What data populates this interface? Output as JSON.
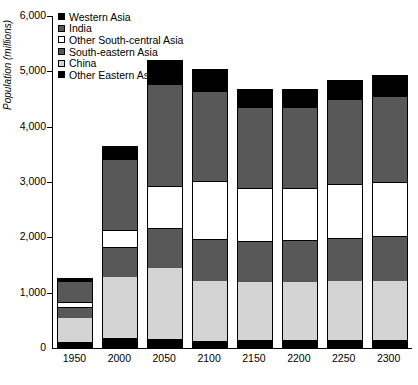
{
  "chart_data": {
    "type": "bar",
    "subtype": "stacked-column",
    "title": "",
    "xlabel": "",
    "ylabel": "Population (millions)",
    "ylim": [
      0,
      6000
    ],
    "ytick_labels": [
      "6,000",
      "5,000",
      "4,000",
      "3,000",
      "2,000",
      "1,000",
      "0"
    ],
    "ytick_values": [
      6000,
      5000,
      4000,
      3000,
      2000,
      1000,
      0
    ],
    "grid": false,
    "legend_position": "top-left-inside",
    "categories": [
      "1950",
      "2000",
      "2050",
      "2100",
      "2150",
      "2200",
      "2250",
      "2300"
    ],
    "series": [
      {
        "name": "Other Eastern Asia",
        "swatch": "#000000",
        "values": [
          100,
          180,
          170,
          130,
          140,
          140,
          140,
          140
        ]
      },
      {
        "name": "China",
        "swatch": "#d4d4d4",
        "values": [
          450,
          1100,
          1280,
          1090,
          1050,
          1050,
          1070,
          1070
        ]
      },
      {
        "name": "South-eastern Asia",
        "swatch": "#585858",
        "values": [
          180,
          530,
          700,
          740,
          720,
          740,
          760,
          790
        ]
      },
      {
        "name": "Other South-central Asia",
        "swatch": "#ffffff",
        "values": [
          100,
          330,
          780,
          1050,
          990,
          960,
          990,
          1000
        ]
      },
      {
        "name": "India",
        "swatch": "#585858",
        "values": [
          370,
          1260,
          1830,
          1620,
          1440,
          1450,
          1520,
          1540
        ]
      },
      {
        "name": "Western Asia",
        "swatch": "#000000",
        "values": [
          60,
          250,
          450,
          410,
          340,
          340,
          370,
          390
        ]
      }
    ],
    "totals": [
      1260,
      3650,
      5210,
      5040,
      4680,
      4680,
      4850,
      4930
    ]
  },
  "legend": {
    "items": [
      {
        "label": "Western Asia"
      },
      {
        "label": "India"
      },
      {
        "label": "Other South-central Asia"
      },
      {
        "label": "South-eastern Asia"
      },
      {
        "label": "China"
      },
      {
        "label": "Other Eastern Asia"
      }
    ]
  }
}
